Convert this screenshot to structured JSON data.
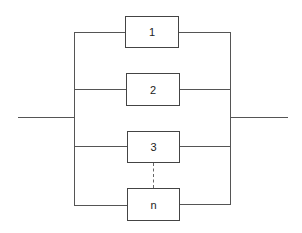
{
  "diagram": {
    "type": "parallel-system-block-diagram",
    "colors": {
      "line": "#555555",
      "box_border": "#444444",
      "text": "#222222",
      "background": "#ffffff"
    },
    "blocks": [
      {
        "label": "1"
      },
      {
        "label": "2"
      },
      {
        "label": "3"
      },
      {
        "label": "n"
      }
    ],
    "ellipsis_connector": "dashed line between block 3 and block n"
  }
}
